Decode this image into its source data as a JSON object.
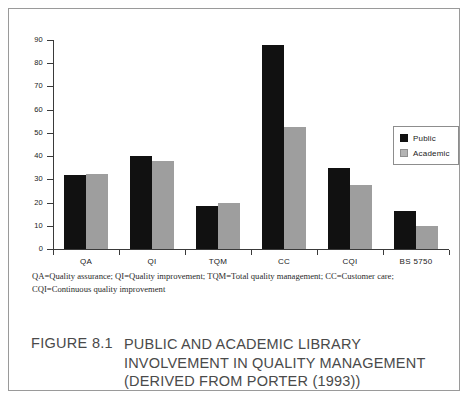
{
  "figure": {
    "caption_number": "FIGURE 8.1",
    "caption_lines": [
      "PUBLIC AND ACADEMIC LIBRARY",
      "INVOLVEMENT IN QUALITY MANAGEMENT",
      "(DERIVED FROM PORTER (1993))"
    ],
    "footnote_lines": [
      "QA=Quality assurance; QI=Quality improvement; TQM=Total quality management; CC=Customer care;",
      "CQI=Continuous quality improvement"
    ]
  },
  "legend": {
    "entries": [
      {
        "label": "Public",
        "color": "#111111"
      },
      {
        "label": "Academic",
        "color": "#b4b4b4"
      }
    ]
  },
  "axis": {
    "y_ticks": [
      "0",
      "10",
      "20",
      "30",
      "40",
      "50",
      "60",
      "70",
      "80",
      "90"
    ]
  },
  "chart_data": {
    "type": "bar",
    "title": "FIGURE 8.1  PUBLIC AND ACADEMIC LIBRARY INVOLVEMENT IN QUALITY MANAGEMENT (DERIVED FROM PORTER (1993))",
    "xlabel": "",
    "ylabel": "",
    "ylim": [
      0,
      90
    ],
    "ytick_step": 10,
    "grid": false,
    "legend_position": "right",
    "categories": [
      "QA",
      "QI",
      "TQM",
      "CC",
      "CQI",
      "BS 5750"
    ],
    "series": [
      {
        "name": "Public",
        "color": "#111111",
        "values": [
          32,
          40,
          18.5,
          88,
          35,
          16.5
        ]
      },
      {
        "name": "Academic",
        "color": "#9e9e9e",
        "values": [
          32.5,
          38,
          20,
          52.5,
          27.5,
          10
        ]
      }
    ]
  }
}
